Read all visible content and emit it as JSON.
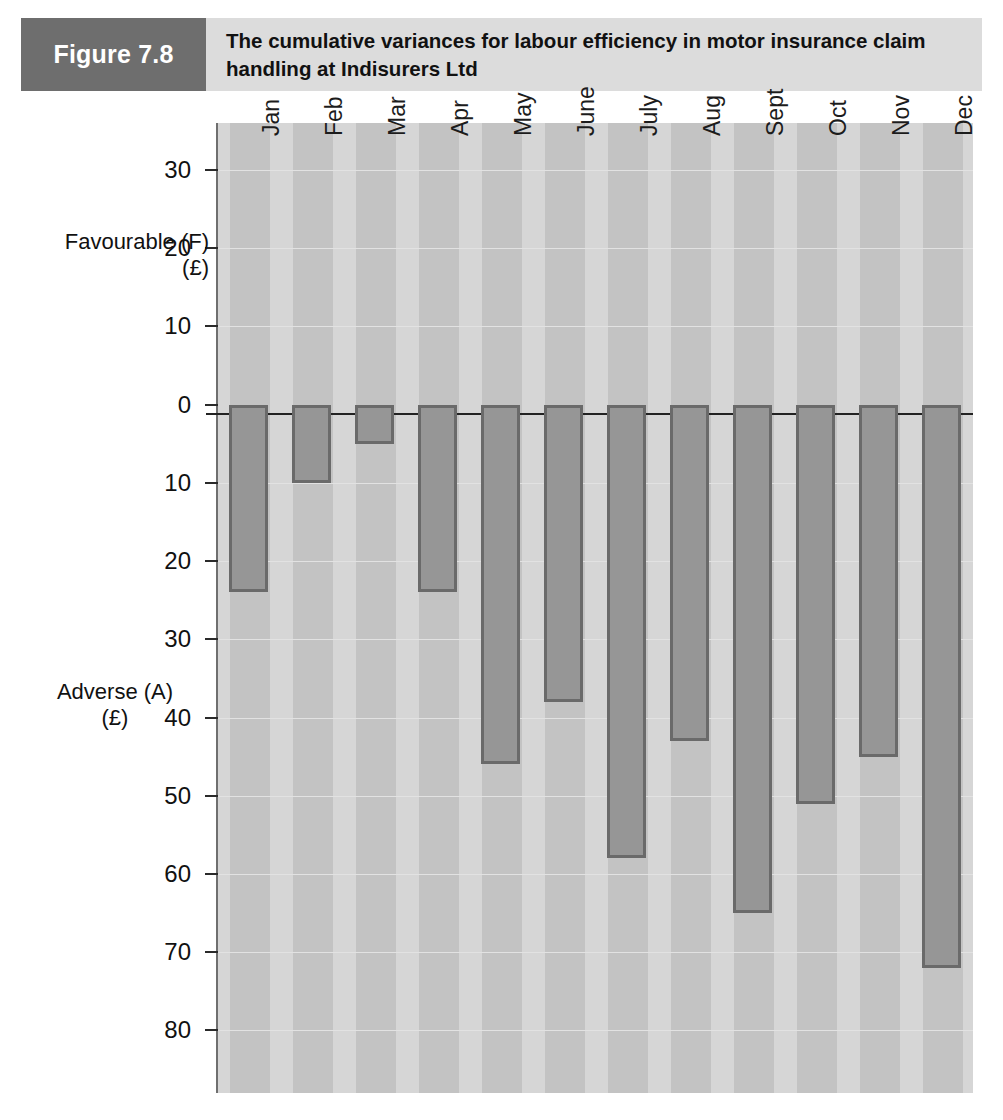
{
  "header": {
    "figure_tag": "Figure 7.8",
    "title": "The cumulative variances for labour efficiency in motor insurance claim handling at Indisurers Ltd",
    "tag_bg": "#6e6e6e",
    "title_bg": "#dcdcdc"
  },
  "chart_data": {
    "type": "bar",
    "title": "The cumulative variances for labour efficiency in motor insurance claim handling at Indisurers Ltd",
    "xlabel": "",
    "ylabel": "Favourable (F) (£) / Adverse (A) (£)",
    "orientation": "vertical",
    "grid": true,
    "legend": "none",
    "axis_top_label": "Favourable (F)\n(£)",
    "axis_bottom_label": "Adverse (A)\n(£)",
    "note": "All values are adverse (plotted downward from zero); tick labels below zero are unsigned magnitudes.",
    "ylim": [
      -88,
      36
    ],
    "yticks": [
      30,
      20,
      10,
      0,
      -10,
      -20,
      -30,
      -40,
      -50,
      -60,
      -70,
      -80
    ],
    "ytick_labels": [
      "30",
      "20",
      "10",
      "0",
      "10",
      "20",
      "30",
      "40",
      "50",
      "60",
      "70",
      "80"
    ],
    "categories": [
      "Jan",
      "Feb",
      "Mar",
      "Apr",
      "May",
      "June",
      "July",
      "Aug",
      "Sept",
      "Oct",
      "Nov",
      "Dec"
    ],
    "values": [
      -24,
      -10,
      -5,
      -24,
      -46,
      -38,
      -58,
      -43,
      -65,
      -51,
      -45,
      -72
    ],
    "magnitudes": [
      24,
      10,
      5,
      24,
      46,
      38,
      58,
      43,
      65,
      51,
      45,
      72
    ],
    "series": [
      {
        "name": "Cumulative labour efficiency variance",
        "values": [
          -24,
          -10,
          -5,
          -24,
          -46,
          -38,
          -58,
          -43,
          -65,
          -51,
          -45,
          -72
        ]
      }
    ],
    "colors": {
      "bar_fill": "#969696",
      "bar_border": "#6a6a6a",
      "plot_band_light": "#d6d6d6",
      "plot_band_dark": "#c3c3c3",
      "gridline": "#e2e2e2",
      "zero_line": "#222222",
      "axis": "#6f6f6f"
    }
  }
}
